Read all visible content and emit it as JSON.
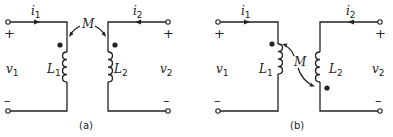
{
  "figure": {
    "panels": [
      {
        "caption": "(a)",
        "current_left": "i",
        "current_left_sub": "1",
        "current_right": "i",
        "current_right_sub": "2",
        "voltage_left": "v",
        "voltage_left_sub": "1",
        "voltage_right": "v",
        "voltage_right_sub": "2",
        "inductor_left": "L",
        "inductor_left_sub": "1",
        "inductor_right": "L",
        "inductor_right_sub": "2",
        "mutual": "M",
        "plus": "+",
        "minus": "–",
        "dot_convention": "both dots top"
      },
      {
        "caption": "(b)",
        "current_left": "i",
        "current_left_sub": "1",
        "current_right": "i",
        "current_right_sub": "2",
        "voltage_left": "v",
        "voltage_left_sub": "1",
        "voltage_right": "v",
        "voltage_right_sub": "2",
        "inductor_left": "L",
        "inductor_left_sub": "1",
        "inductor_right": "L",
        "inductor_right_sub": "2",
        "mutual": "M",
        "plus": "+",
        "minus": "–",
        "dot_convention": "L1 dot top, L2 dot bottom"
      }
    ]
  }
}
